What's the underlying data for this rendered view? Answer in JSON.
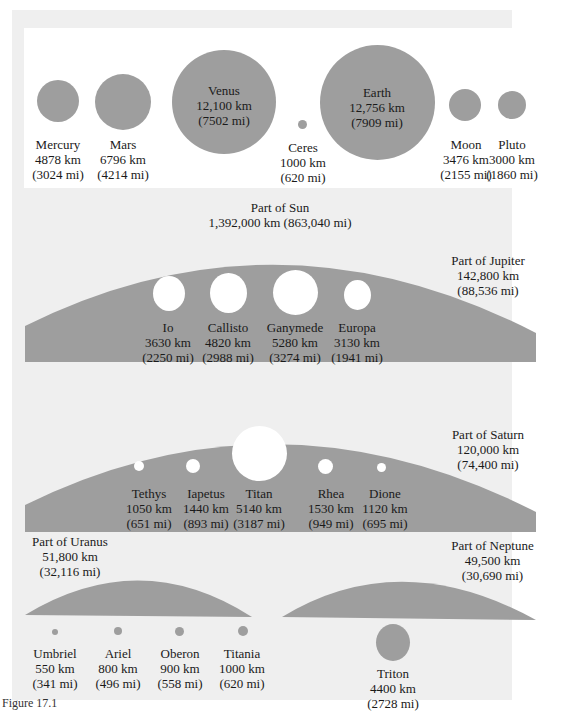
{
  "top_row": [
    {
      "name": "Mercury",
      "km": "4878 km",
      "mi": "(3024 mi)"
    },
    {
      "name": "Mars",
      "km": "6796 km",
      "mi": "(4214 mi)"
    },
    {
      "name": "Venus",
      "km": "12,100 km",
      "mi": "(7502 mi)"
    },
    {
      "name": "Ceres",
      "km": "1000 km",
      "mi": "(620 mi)"
    },
    {
      "name": "Earth",
      "km": "12,756 km",
      "mi": "(7909 mi)"
    },
    {
      "name": "Moon",
      "km": "3476 km",
      "mi": "(2155 mi)"
    },
    {
      "name": "Pluto",
      "km": "3000 km",
      "mi": "(1860 mi)"
    }
  ],
  "sun": {
    "title": "Part of Sun",
    "size": "1,392,000 km (863,040 mi)"
  },
  "jupiter": {
    "title": "Part of Jupiter",
    "km": "142,800 km",
    "mi": "(88,536 mi)",
    "moons": [
      {
        "name": "Io",
        "km": "3630 km",
        "mi": "(2250 mi)"
      },
      {
        "name": "Callisto",
        "km": "4820 km",
        "mi": "(2988 mi)"
      },
      {
        "name": "Ganymede",
        "km": "5280 km",
        "mi": "(3274 mi)"
      },
      {
        "name": "Europa",
        "km": "3130 km",
        "mi": "(1941 mi)"
      }
    ]
  },
  "saturn": {
    "title": "Part of Saturn",
    "km": "120,000 km",
    "mi": "(74,400 mi)",
    "moons": [
      {
        "name": "Tethys",
        "km": "1050 km",
        "mi": "(651 mi)"
      },
      {
        "name": "Iapetus",
        "km": "1440 km",
        "mi": "(893 mi)"
      },
      {
        "name": "Titan",
        "km": "5140 km",
        "mi": "(3187 mi)"
      },
      {
        "name": "Rhea",
        "km": "1530 km",
        "mi": "(949 mi)"
      },
      {
        "name": "Dione",
        "km": "1120 km",
        "mi": "(695 mi)"
      }
    ]
  },
  "uranus": {
    "title": "Part of Uranus",
    "km": "51,800 km",
    "mi": "(32,116 mi)",
    "moons": [
      {
        "name": "Umbriel",
        "km": "550 km",
        "mi": "(341 mi)"
      },
      {
        "name": "Ariel",
        "km": "800 km",
        "mi": "(496 mi)"
      },
      {
        "name": "Oberon",
        "km": "900 km",
        "mi": "(558 mi)"
      },
      {
        "name": "Titania",
        "km": "1000 km",
        "mi": "(620 mi)"
      }
    ]
  },
  "neptune": {
    "title": "Part of Neptune",
    "km": "49,500 km",
    "mi": "(30,690 mi)",
    "moons": [
      {
        "name": "Triton",
        "km": "4400 km",
        "mi": "(2728 mi)"
      }
    ]
  },
  "caption": "Figure 17.1",
  "colors": {
    "body": "#9e9e9e",
    "background": "#efefef",
    "hole": "#ffffff"
  }
}
